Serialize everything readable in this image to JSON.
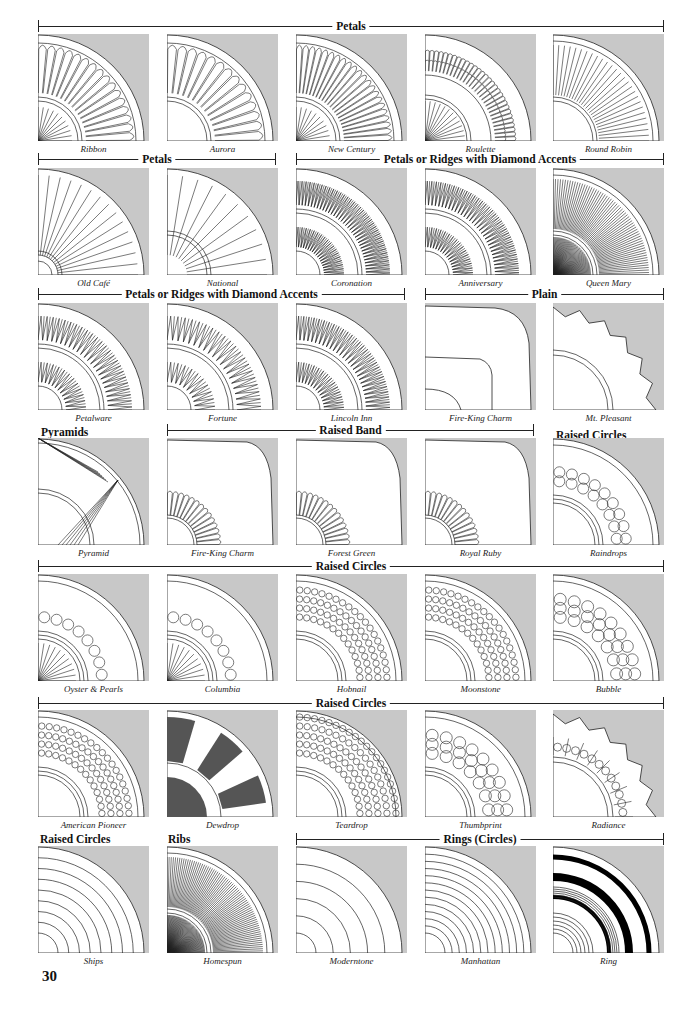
{
  "page": {
    "number": "30",
    "plate_gray": "#c8c8c8",
    "ink": "#222222"
  },
  "brackets": [
    {
      "label": "Petals",
      "x": 38,
      "w": 626,
      "y": 19
    },
    {
      "label": "Petals",
      "x": 38,
      "w": 238,
      "y": 152
    },
    {
      "label": "Petals or Ridges with Diamond Accents",
      "x": 296,
      "w": 368,
      "y": 152
    },
    {
      "label": "Petals or Ridges with Diamond Accents",
      "x": 38,
      "w": 367,
      "y": 287
    },
    {
      "label": "Plain",
      "x": 425,
      "w": 239,
      "y": 287
    },
    {
      "label": "Raised Band",
      "x": 167,
      "w": 367,
      "y": 423
    },
    {
      "label": "Raised Circles",
      "x": 38,
      "w": 626,
      "y": 559
    },
    {
      "label": "Raised Circles",
      "x": 38,
      "w": 626,
      "y": 696
    },
    {
      "label": "Rings (Circles)",
      "x": 296,
      "w": 368,
      "y": 832
    }
  ],
  "headings": [
    {
      "label": "Pyramids",
      "x": 41,
      "y": 425
    },
    {
      "label": "Raised Circles",
      "x": 556,
      "y": 428
    },
    {
      "label": "Raised Circles",
      "x": 40,
      "y": 832
    },
    {
      "label": "Ribs",
      "x": 168,
      "y": 832
    }
  ],
  "patterns": [
    {
      "name": "Ribbon",
      "row": 0,
      "col": 0,
      "style": "petals",
      "n": 16,
      "inner": true
    },
    {
      "name": "Aurora",
      "row": 0,
      "col": 1,
      "style": "petals",
      "n": 14,
      "inner": false
    },
    {
      "name": "New Century",
      "row": 0,
      "col": 2,
      "style": "petals",
      "n": 22,
      "inner": true
    },
    {
      "name": "Roulette",
      "row": 0,
      "col": 3,
      "style": "beads",
      "n": 30,
      "inner": true
    },
    {
      "name": "Round Robin",
      "row": 0,
      "col": 4,
      "style": "ribs",
      "n": 26,
      "inner": false
    },
    {
      "name": "Old Café",
      "row": 1,
      "col": 0,
      "style": "spokes",
      "n": 14,
      "inner": true
    },
    {
      "name": "National",
      "row": 1,
      "col": 1,
      "style": "spokes",
      "n": 10,
      "inner": false
    },
    {
      "name": "Coronation",
      "row": 1,
      "col": 2,
      "style": "diamond",
      "n": 36,
      "inner": true
    },
    {
      "name": "Anniversary",
      "row": 1,
      "col": 3,
      "style": "diamond",
      "n": 32,
      "inner": true
    },
    {
      "name": "Queen Mary",
      "row": 1,
      "col": 4,
      "style": "ribs",
      "n": 60,
      "inner": true
    },
    {
      "name": "Petalware",
      "row": 2,
      "col": 0,
      "style": "diamond",
      "n": 24,
      "inner": true
    },
    {
      "name": "Fortune",
      "row": 2,
      "col": 1,
      "style": "diamond",
      "n": 20,
      "inner": true
    },
    {
      "name": "Lincoln Inn",
      "row": 2,
      "col": 2,
      "style": "diamond",
      "n": 28,
      "inner": true
    },
    {
      "name": "Fire-King Charm",
      "row": 2,
      "col": 3,
      "style": "square",
      "n": 0,
      "inner": true
    },
    {
      "name": "Mt. Pleasant",
      "row": 2,
      "col": 4,
      "style": "scallop",
      "n": 0,
      "inner": true
    },
    {
      "name": "Pyramid",
      "row": 3,
      "col": 0,
      "style": "pyramid",
      "n": 0,
      "inner": true
    },
    {
      "name": "Fire-King Charm",
      "row": 3,
      "col": 1,
      "style": "band",
      "n": 14,
      "inner": true
    },
    {
      "name": "Forest Green",
      "row": 3,
      "col": 2,
      "style": "band",
      "n": 14,
      "inner": true
    },
    {
      "name": "Royal Ruby",
      "row": 3,
      "col": 3,
      "style": "band",
      "n": 14,
      "inner": true
    },
    {
      "name": "Raindrops",
      "row": 3,
      "col": 4,
      "style": "circles",
      "n": 2,
      "inner": true
    },
    {
      "name": "Oyster & Pearls",
      "row": 4,
      "col": 0,
      "style": "circles",
      "n": 1,
      "inner": true
    },
    {
      "name": "Columbia",
      "row": 4,
      "col": 1,
      "style": "circles",
      "n": 1,
      "inner": true
    },
    {
      "name": "Hobnail",
      "row": 4,
      "col": 2,
      "style": "circles",
      "n": 4,
      "inner": true
    },
    {
      "name": "Moonstone",
      "row": 4,
      "col": 3,
      "style": "circles",
      "n": 4,
      "inner": true
    },
    {
      "name": "Bubble",
      "row": 4,
      "col": 4,
      "style": "circles",
      "n": 3,
      "inner": true
    },
    {
      "name": "American Pioneer",
      "row": 5,
      "col": 0,
      "style": "circles",
      "n": 4,
      "inner": true
    },
    {
      "name": "Dewdrop",
      "row": 5,
      "col": 1,
      "style": "dewdrop",
      "n": 0,
      "inner": true
    },
    {
      "name": "Teardrop",
      "row": 5,
      "col": 2,
      "style": "circles",
      "n": 5,
      "inner": true
    },
    {
      "name": "Thumbprint",
      "row": 5,
      "col": 3,
      "style": "circles",
      "n": 3,
      "inner": true
    },
    {
      "name": "Radiance",
      "row": 5,
      "col": 4,
      "style": "scallop",
      "n": 0,
      "inner": true
    },
    {
      "name": "Ships",
      "row": 6,
      "col": 0,
      "style": "rings",
      "n": 8,
      "inner": true
    },
    {
      "name": "Homespun",
      "row": 6,
      "col": 1,
      "style": "ribs",
      "n": 70,
      "inner": true
    },
    {
      "name": "Moderntone",
      "row": 6,
      "col": 2,
      "style": "rings",
      "n": 5,
      "inner": false
    },
    {
      "name": "Manhattan",
      "row": 6,
      "col": 3,
      "style": "rings",
      "n": 12,
      "inner": false
    },
    {
      "name": "Ring",
      "row": 6,
      "col": 4,
      "style": "blackrings",
      "n": 0,
      "inner": true
    }
  ]
}
